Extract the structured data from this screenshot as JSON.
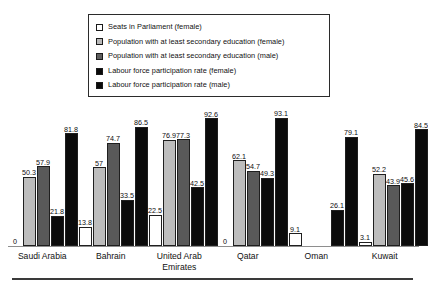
{
  "legend": {
    "position": "top-center",
    "items": [
      {
        "label": "Seats in Parliament (female)",
        "swatch": "white-square",
        "style": "b-white",
        "sw": "sw-white"
      },
      {
        "label": "Population with at least secondary education (female)",
        "swatch": "light-gray-square",
        "style": "b-light",
        "sw": "sw-light"
      },
      {
        "label": "Population with at least secondary education (male)",
        "swatch": "dark-gray-square",
        "style": "b-mid",
        "sw": "sw-mid"
      },
      {
        "label": "Labour force participation rate (female)",
        "swatch": "black-square",
        "style": "b-black",
        "sw": "sw-black"
      },
      {
        "label": "Labour force participation rate (male)",
        "swatch": "black-square",
        "style": "b-black",
        "sw": "sw-black"
      }
    ]
  },
  "colors": {
    "seats_parliament_female": "#ffffff",
    "secondary_education_female": "#bdbdbd",
    "secondary_education_male": "#595959",
    "labour_force_female": "#0b0b0b",
    "labour_force_male": "#0b0b0b",
    "outline": "#1f1f1f",
    "baseline": "#8e8e8e",
    "text": "#111111"
  },
  "chart_data": {
    "type": "bar",
    "title": "",
    "subtitle": "",
    "xlabel": "",
    "ylabel": "",
    "ylim": [
      0,
      100
    ],
    "grid": false,
    "legend_position": "top-center",
    "categories": [
      "Saudi Arabia",
      "Bahrain",
      "United Arab Emirates",
      "Qatar",
      "Oman",
      "Kuwait"
    ],
    "series": [
      {
        "name": "Seats in Parliament (female)",
        "values": [
          0,
          13.8,
          22.5,
          0,
          9.1,
          3.1
        ]
      },
      {
        "name": "Population with at least secondary education (female)",
        "values": [
          50.3,
          57,
          76.9,
          62.1,
          null,
          52.2
        ]
      },
      {
        "name": "Population with at least secondary education (male)",
        "values": [
          57.9,
          74.7,
          77.3,
          54.7,
          null,
          43.9
        ]
      },
      {
        "name": "Labour force participation rate (female)",
        "values": [
          21.8,
          33.5,
          42.5,
          49.3,
          26.1,
          45.6
        ]
      },
      {
        "name": "Labour force participation rate (male)",
        "values": [
          81.8,
          86.5,
          92.6,
          93.1,
          79.1,
          84.5
        ]
      }
    ],
    "value_labels": {
      "Saudi Arabia": [
        "0",
        "50.3",
        "57.9",
        "21.8",
        "81.8"
      ],
      "Bahrain": [
        "13.8",
        "57",
        "74.7",
        "33.5",
        "86.5"
      ],
      "United Arab Emirates": [
        "22.5",
        "76.9",
        "77.3",
        "42.5",
        "92.6"
      ],
      "Qatar": [
        "0",
        "62.1",
        "54.7",
        "49.3",
        "93.1"
      ],
      "Oman": [
        "9.1",
        "",
        "",
        "26.1",
        "79.1"
      ],
      "Kuwait": [
        "3.1",
        "52.2",
        "43.9",
        "45.6",
        "84.5"
      ]
    }
  }
}
